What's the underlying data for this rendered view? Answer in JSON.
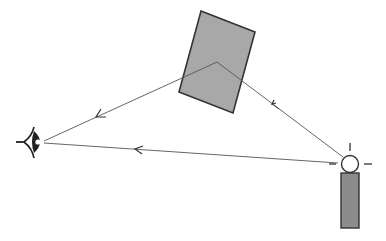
{
  "diagram": {
    "title": "Light reflection: direct and reflected rays reaching the eye",
    "colors": {
      "background": "#ffffff",
      "stroke": "#333333",
      "object_fill": "#a8a8a8",
      "lamp_fill": "#8c8c8c",
      "bulb_fill": "#ffffff"
    },
    "elements": {
      "eye": {
        "label": "eye",
        "icon": "eye-icon"
      },
      "reflector": {
        "label": "reflecting surface (rectangle)"
      },
      "light_source": {
        "label": "lamp with light bulb",
        "icon": "light-bulb-icon"
      },
      "ray_direct": {
        "label": "direct ray from lamp to eye"
      },
      "ray_incident": {
        "label": "incident ray from lamp to surface"
      },
      "ray_reflected": {
        "label": "reflected ray from surface to eye"
      }
    }
  }
}
